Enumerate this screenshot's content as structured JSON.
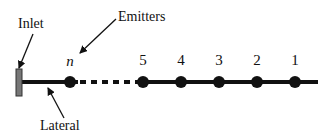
{
  "labels": {
    "inlet": "Inlet",
    "emitters": "Emitters",
    "lateral": "Lateral"
  },
  "emitters": [
    {
      "label": "n",
      "x": 70
    },
    {
      "label": "5",
      "x": 143
    },
    {
      "label": "4",
      "x": 181
    },
    {
      "label": "3",
      "x": 219
    },
    {
      "label": "2",
      "x": 257
    },
    {
      "label": "1",
      "x": 295
    }
  ],
  "colors": {
    "line": "#111111",
    "inlet_fill": "#777777",
    "emitter": "#111111"
  }
}
